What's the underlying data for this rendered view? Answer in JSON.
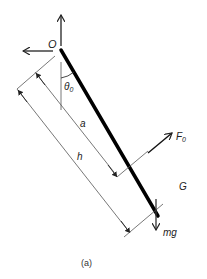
{
  "figure": {
    "caption": "(a)",
    "labels": {
      "pivot": "O",
      "angle": "θ",
      "angle_sub": "0",
      "dist_a": "a",
      "dist_h": "h",
      "force": "F",
      "force_sub": "0",
      "center": "G",
      "weight": "mg"
    },
    "colors": {
      "rod": "#000000",
      "lines": "#333333",
      "thin": "#666666"
    }
  }
}
